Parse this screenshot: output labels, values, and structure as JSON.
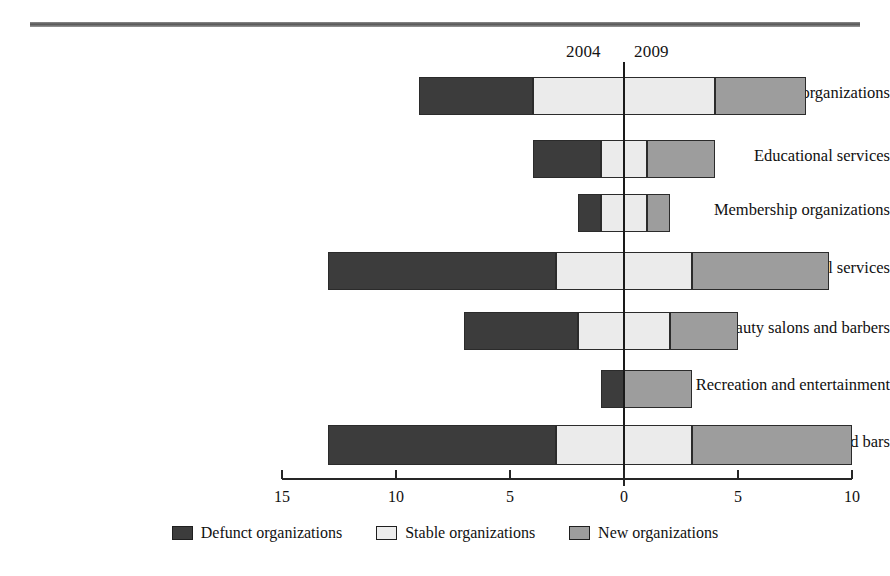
{
  "figure": {
    "year_left_header": "2004",
    "year_right_header": "2009"
  },
  "legend": {
    "items": [
      {
        "key": "defunct",
        "label": "Defunct organizations",
        "color": "#3c3c3c"
      },
      {
        "key": "stable",
        "label": "Stable organizations",
        "color": "#ededed"
      },
      {
        "key": "new",
        "label": "New organizations",
        "color": "#9d9d9d"
      }
    ]
  },
  "axis": {
    "ticks": [
      "15",
      "10",
      "5",
      "0",
      "5",
      "10"
    ],
    "tick_values": [
      -15,
      -10,
      -5,
      0,
      5,
      10
    ],
    "min": -15,
    "max": 10
  },
  "chart_data": {
    "type": "bar",
    "orientation": "horizontal",
    "stacked": true,
    "diverging": true,
    "title": "",
    "subtitle": "",
    "xlabel": "",
    "ylabel": "",
    "xlim": [
      -15,
      10
    ],
    "grid": false,
    "legend_position": "bottom",
    "zero_label_left": "2004",
    "zero_label_right": "2009",
    "categories": [
      "Religious organizations",
      "Educational services",
      "Membership organizations",
      "Social services",
      "Beauty salons and barbers",
      "Recreation and entertainment",
      "Restaurants, cafes, and bars"
    ],
    "series": [
      {
        "name": "Defunct organizations",
        "color": "#3c3c3c",
        "values": [
          5,
          3,
          1,
          10,
          5,
          1,
          10
        ]
      },
      {
        "name": "Stable organizations",
        "color": "#ededed",
        "values": [
          4,
          1,
          1,
          3,
          2,
          0,
          3
        ]
      },
      {
        "name": "New organizations",
        "color": "#9d9d9d",
        "values": [
          4,
          3,
          1,
          6,
          3,
          3,
          7
        ]
      }
    ],
    "bars": [
      {
        "category": "Religious organizations",
        "defunct_from": -9,
        "defunct_to": -4,
        "stable_left_from": -4,
        "stable_left_to": 0,
        "stable_right_from": 0,
        "stable_right_to": 4,
        "new_from": 4,
        "new_to": 8
      },
      {
        "category": "Educational services",
        "defunct_from": -4,
        "defunct_to": -1,
        "stable_left_from": -1,
        "stable_left_to": 0,
        "stable_right_from": 0,
        "stable_right_to": 1,
        "new_from": 1,
        "new_to": 4
      },
      {
        "category": "Membership organizations",
        "defunct_from": -2,
        "defunct_to": -1,
        "stable_left_from": -1,
        "stable_left_to": 0,
        "stable_right_from": 0,
        "stable_right_to": 1,
        "new_from": 1,
        "new_to": 2
      },
      {
        "category": "Social services",
        "defunct_from": -13,
        "defunct_to": -3,
        "stable_left_from": -3,
        "stable_left_to": 0,
        "stable_right_from": 0,
        "stable_right_to": 3,
        "new_from": 3,
        "new_to": 9
      },
      {
        "category": "Beauty salons and barbers",
        "defunct_from": -7,
        "defunct_to": -2,
        "stable_left_from": -2,
        "stable_left_to": 0,
        "stable_right_from": 0,
        "stable_right_to": 2,
        "new_from": 2,
        "new_to": 5
      },
      {
        "category": "Recreation and entertainment",
        "defunct_from": -1,
        "defunct_to": 0,
        "stable_left_from": 0,
        "stable_left_to": 0,
        "stable_right_from": 0,
        "stable_right_to": 0,
        "new_from": 0,
        "new_to": 3
      },
      {
        "category": "Restaurants, cafes, and bars",
        "defunct_from": -13,
        "defunct_to": -3,
        "stable_left_from": -3,
        "stable_left_to": 0,
        "stable_right_from": 0,
        "stable_right_to": 3,
        "new_from": 3,
        "new_to": 10
      }
    ]
  },
  "labels": {
    "c0": "Religious organizations",
    "c1": "Educational services",
    "c2": "Membership organizations",
    "c3": "Social services",
    "c4": "Beauty salons and barbers",
    "c5": "Recreation and entertainment",
    "c6": "Restaurants, cafes, and bars"
  },
  "ticks": {
    "t0": "15",
    "t1": "10",
    "t2": "5",
    "t3": "0",
    "t4": "5",
    "t5": "10"
  }
}
